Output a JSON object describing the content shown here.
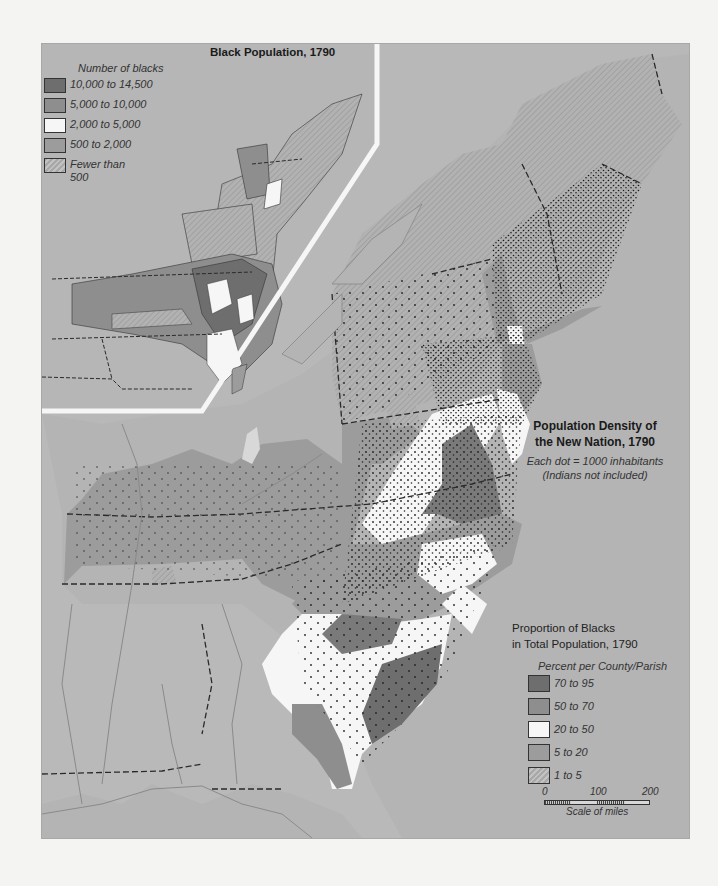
{
  "inset": {
    "title": "Black Population, 1790",
    "legend_heading": "Number of blacks",
    "legend": [
      {
        "label": "10,000 to 14,500",
        "color": "#6e6e6e"
      },
      {
        "label": "5,000 to 10,000",
        "color": "#8e8e8e"
      },
      {
        "label": "2,000 to 5,000",
        "color": "#f6f6f6"
      },
      {
        "label": "500 to 2,000",
        "color": "#9c9c9c"
      },
      {
        "label": "Fewer than 500",
        "color": "hatched"
      }
    ]
  },
  "main": {
    "title_line1": "Population Density of",
    "title_line2": "the New Nation, 1790",
    "subtitle_line1": "Each dot = 1000 inhabitants",
    "subtitle_line2": "(Indians not included)"
  },
  "proportion": {
    "title_line1": "Proportion of Blacks",
    "title_line2": "in Total Population, 1790",
    "legend_heading": "Percent per County/Parish",
    "legend": [
      {
        "label": "70 to 95",
        "color": "#6e6e6e"
      },
      {
        "label": "50 to 70",
        "color": "#8e8e8e"
      },
      {
        "label": "20 to 50",
        "color": "#f6f6f6"
      },
      {
        "label": "5 to 20",
        "color": "#9c9c9c"
      },
      {
        "label": "1 to 5",
        "color": "hatched"
      }
    ]
  },
  "scale": {
    "ticks": [
      "0",
      "100",
      "200"
    ],
    "caption": "Scale of miles"
  },
  "colors": {
    "water": "#b4b4b4",
    "land_outside": "#b8b8b8",
    "c70_95": "#6e6e6e",
    "c50_70": "#8e8e8e",
    "c20_50": "#f6f6f6",
    "c5_20": "#9c9c9c",
    "c1_5": "#b0b0b0"
  }
}
